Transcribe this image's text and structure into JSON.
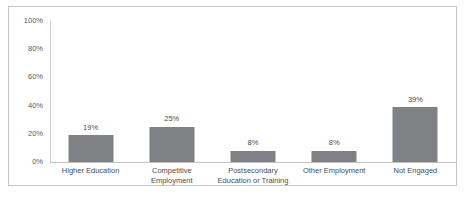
{
  "chart_data": {
    "type": "bar",
    "title": "",
    "subtitle": "",
    "xlabel": "",
    "ylabel": "",
    "ylim": [
      0,
      100
    ],
    "ytick_labels": [
      "100%",
      "80%",
      "60%",
      "40%",
      "20%",
      "0%"
    ],
    "ytick_values": [
      100,
      80,
      60,
      40,
      20,
      0
    ],
    "grid": false,
    "legend": false,
    "legend_position": "none",
    "categories": [
      "Higher Education",
      "Competitive\nEmployment",
      "Postsecondary\nEducation or Training",
      "Other Employment",
      "Not Engaged"
    ],
    "values": [
      19,
      25,
      8,
      8,
      39
    ],
    "data_labels": [
      "19%",
      "25%",
      "8%",
      "8%",
      "39%"
    ],
    "bar_color": "#808184",
    "axis_color": "#c3c3c3",
    "frame_color": "#c6c6c6",
    "text_color": "#4d4d4f"
  }
}
